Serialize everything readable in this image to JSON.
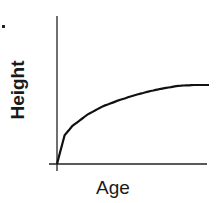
{
  "chart_data": {
    "type": "line",
    "title": "",
    "xlabel": "Age",
    "ylabel": "Height",
    "grid": false,
    "legend": null,
    "ticks": false,
    "series": [
      {
        "name": "Height vs Age",
        "x": [
          0,
          0.05,
          0.1,
          0.2,
          0.3,
          0.4,
          0.5,
          0.6,
          0.7,
          0.8,
          0.9,
          1.0
        ],
        "values": [
          0,
          0.35,
          0.46,
          0.6,
          0.7,
          0.77,
          0.83,
          0.88,
          0.92,
          0.95,
          0.96,
          0.96
        ]
      }
    ],
    "xlim": [
      0,
      1
    ],
    "ylim": [
      0,
      1.1
    ]
  },
  "labels": {
    "y_axis": "Height",
    "x_axis": "Age"
  }
}
